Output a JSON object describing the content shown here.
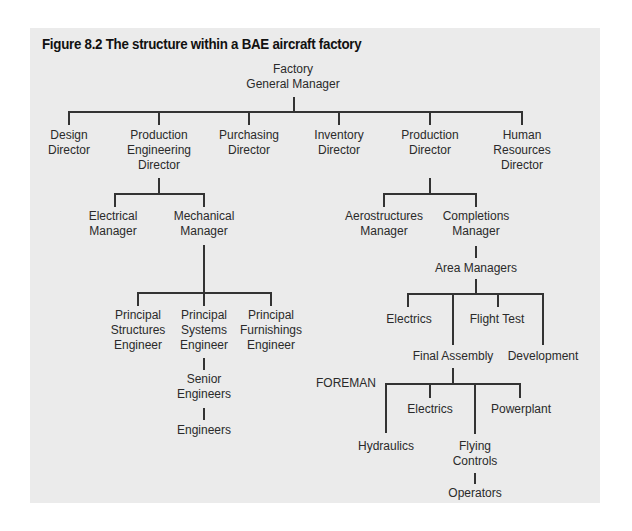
{
  "figure": {
    "title": "Figure 8.2  The structure within a BAE aircraft factory"
  },
  "colors": {
    "panel_background": "#ebebeb",
    "line": "#333333",
    "text": "#2a2a2a"
  },
  "org": {
    "root": {
      "lines": [
        "Factory",
        "General Manager"
      ]
    },
    "directors": [
      {
        "lines": [
          "Design",
          "Director"
        ]
      },
      {
        "lines": [
          "Production",
          "Engineering",
          "Director"
        ]
      },
      {
        "lines": [
          "Purchasing",
          "Director"
        ]
      },
      {
        "lines": [
          "Inventory",
          "Director"
        ]
      },
      {
        "lines": [
          "Production",
          "Director"
        ]
      },
      {
        "lines": [
          "Human",
          "Resources",
          "Director"
        ]
      }
    ],
    "prod_eng": {
      "managers": [
        {
          "lines": [
            "Electrical",
            "Manager"
          ]
        },
        {
          "lines": [
            "Mechanical",
            "Manager"
          ]
        }
      ],
      "principals": [
        {
          "lines": [
            "Principal",
            "Structures",
            "Engineer"
          ]
        },
        {
          "lines": [
            "Principal",
            "Systems",
            "Engineer"
          ]
        },
        {
          "lines": [
            "Principal",
            "Furnishings",
            "Engineer"
          ]
        }
      ],
      "senior": {
        "lines": [
          "Senior",
          "Engineers"
        ]
      },
      "engineers": {
        "lines": [
          "Engineers"
        ]
      }
    },
    "production": {
      "managers": [
        {
          "lines": [
            "Aerostructures",
            "Manager"
          ]
        },
        {
          "lines": [
            "Completions",
            "Manager"
          ]
        }
      ],
      "area_managers": {
        "lines": [
          "Area Managers"
        ]
      },
      "areas": [
        {
          "lines": [
            "Electrics"
          ]
        },
        {
          "lines": [
            "Final Assembly"
          ]
        },
        {
          "lines": [
            "Flight Test"
          ]
        },
        {
          "lines": [
            "Development"
          ]
        }
      ],
      "foreman_label": "FOREMAN",
      "foremen": [
        {
          "lines": [
            "Hydraulics"
          ]
        },
        {
          "lines": [
            "Electrics"
          ]
        },
        {
          "lines": [
            "Flying",
            "Controls"
          ]
        },
        {
          "lines": [
            "Powerplant"
          ]
        }
      ],
      "operators": {
        "lines": [
          "Operators"
        ]
      }
    }
  }
}
